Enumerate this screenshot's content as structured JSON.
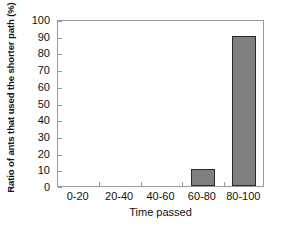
{
  "chart_data": {
    "type": "bar",
    "title": "",
    "subtitle": "",
    "categories": [
      "0-20",
      "20-40",
      "40-60",
      "60-80",
      "80-100"
    ],
    "values": [
      0,
      0,
      0,
      10,
      90
    ],
    "xlabel": "Time passed",
    "ylabel": "Ratio of ants that used the shorter path (%)",
    "ylim": [
      0,
      100
    ],
    "ytick_labels": [
      "0",
      "10",
      "20",
      "30",
      "40",
      "50",
      "60",
      "70",
      "80",
      "90",
      "100"
    ],
    "ytick_values": [
      0,
      10,
      20,
      30,
      40,
      50,
      60,
      70,
      80,
      90,
      100
    ],
    "grid": false,
    "legend": null,
    "bar_color": "#808080",
    "bar_edge_color": "#2b2b2b",
    "axis_color": "#9a9a9a",
    "background": "#ffffff"
  }
}
